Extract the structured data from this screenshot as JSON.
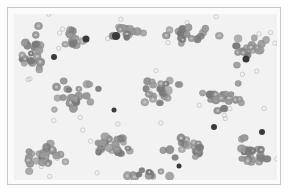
{
  "image": {
    "subject": "blood smear micrograph",
    "palette": {
      "background": "#f2f2f2",
      "frame_border": "#c8c8c8",
      "rbc_fill": "#9a9a9a",
      "rbc_dark": "#7a7a7a",
      "rbc_pale_center": "#c4c4c4",
      "wbc_fill": "#3a3a3a",
      "ghost_cell_stroke": "#a8a8a8"
    },
    "clusters": [
      {
        "cx": 20,
        "cy": 40,
        "rx": 18,
        "ry": 30,
        "n": 26
      },
      {
        "cx": 60,
        "cy": 25,
        "rx": 20,
        "ry": 12,
        "n": 12
      },
      {
        "cx": 110,
        "cy": 18,
        "rx": 25,
        "ry": 10,
        "n": 14
      },
      {
        "cx": 175,
        "cy": 20,
        "rx": 35,
        "ry": 12,
        "n": 18
      },
      {
        "cx": 235,
        "cy": 35,
        "rx": 25,
        "ry": 22,
        "n": 20
      },
      {
        "cx": 60,
        "cy": 80,
        "rx": 30,
        "ry": 18,
        "n": 24
      },
      {
        "cx": 145,
        "cy": 75,
        "rx": 25,
        "ry": 20,
        "n": 22
      },
      {
        "cx": 210,
        "cy": 85,
        "rx": 30,
        "ry": 20,
        "n": 22
      },
      {
        "cx": 30,
        "cy": 140,
        "rx": 25,
        "ry": 22,
        "n": 26
      },
      {
        "cx": 100,
        "cy": 130,
        "rx": 30,
        "ry": 18,
        "n": 22
      },
      {
        "cx": 170,
        "cy": 135,
        "rx": 30,
        "ry": 18,
        "n": 22
      },
      {
        "cx": 235,
        "cy": 140,
        "rx": 25,
        "ry": 20,
        "n": 22
      },
      {
        "cx": 130,
        "cy": 160,
        "rx": 40,
        "ry": 6,
        "n": 14
      }
    ],
    "leukocytes": [
      {
        "x": 72,
        "y": 25,
        "r": 3.5
      },
      {
        "x": 102,
        "y": 22,
        "r": 4
      },
      {
        "x": 40,
        "y": 43,
        "r": 3
      },
      {
        "x": 232,
        "y": 45,
        "r": 3.5
      },
      {
        "x": 100,
        "y": 96,
        "r": 2.5
      },
      {
        "x": 200,
        "y": 113,
        "r": 3
      },
      {
        "x": 248,
        "y": 118,
        "r": 3
      },
      {
        "x": 165,
        "y": 152,
        "r": 2.5
      }
    ]
  }
}
